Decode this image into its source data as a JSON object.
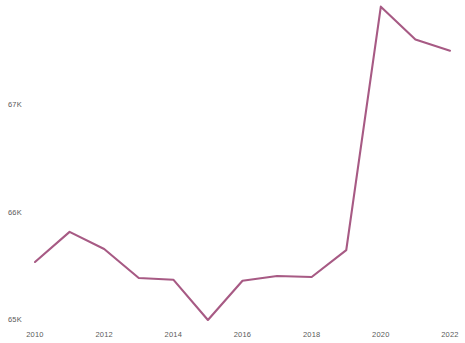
{
  "chart_data": {
    "type": "line",
    "title": "",
    "subtitle": "",
    "xlabel": "",
    "ylabel": "",
    "grid": false,
    "legend": false,
    "legend_position": "none",
    "line_color": "#a75a84",
    "axis_label_color": "#5a5a5a",
    "background_color": "#ffffff",
    "x": [
      2010,
      2011,
      2012,
      2013,
      2014,
      2015,
      2016,
      2017,
      2018,
      2019,
      2020,
      2021,
      2022
    ],
    "values": [
      65540,
      65820,
      65660,
      65390,
      65375,
      65000,
      65365,
      65410,
      65400,
      65650,
      67915,
      67610,
      67505
    ],
    "series": [
      {
        "name": "",
        "values": [
          65540,
          65820,
          65660,
          65390,
          65375,
          65000,
          65365,
          65410,
          65400,
          65650,
          67915,
          67610,
          67505
        ]
      }
    ],
    "xlim": [
      2010,
      2022
    ],
    "ylim": [
      64900,
      68000
    ],
    "x_tick_labels": [
      "2010",
      "2012",
      "2014",
      "2016",
      "2018",
      "2020",
      "2022"
    ],
    "x_tick_values": [
      2010,
      2012,
      2014,
      2016,
      2018,
      2020,
      2022
    ],
    "y_tick_labels": [
      "65K",
      "66K",
      "67K"
    ],
    "y_tick_values": [
      65000,
      66000,
      67000
    ]
  },
  "axes": {
    "y_ticks": [
      {
        "label": "67K",
        "value": 67000
      },
      {
        "label": "66K",
        "value": 66000
      },
      {
        "label": "65K",
        "value": 65000
      }
    ],
    "x_ticks": [
      {
        "label": "2010",
        "value": 2010
      },
      {
        "label": "2012",
        "value": 2012
      },
      {
        "label": "2014",
        "value": 2014
      },
      {
        "label": "2016",
        "value": 2016
      },
      {
        "label": "2018",
        "value": 2018
      },
      {
        "label": "2020",
        "value": 2020
      },
      {
        "label": "2022",
        "value": 2022
      }
    ]
  }
}
